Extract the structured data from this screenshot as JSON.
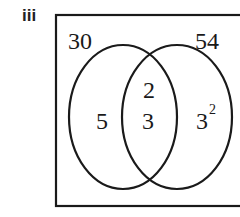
{
  "part_label": "iii",
  "venn": {
    "set_a_label": "30",
    "set_b_label": "54",
    "only_a": "5",
    "intersection_top": "2",
    "intersection_bottom": "3",
    "only_b_base": "3",
    "only_b_exponent": "2"
  }
}
